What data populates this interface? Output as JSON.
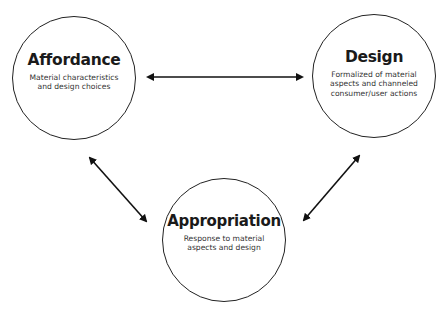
{
  "diagram": {
    "nodes": [
      {
        "id": "affordance",
        "title": "Affordance",
        "description": "Material characteristics\nand design choices"
      },
      {
        "id": "design",
        "title": "Design",
        "description": "Formalized of material\naspects and channeled\nconsumer/user actions"
      },
      {
        "id": "appropriation",
        "title": "Appropriation",
        "description": "Response to material\naspects and design"
      }
    ],
    "edges": [
      {
        "from": "affordance",
        "to": "design",
        "direction": "bidirectional"
      },
      {
        "from": "affordance",
        "to": "appropriation",
        "direction": "bidirectional"
      },
      {
        "from": "design",
        "to": "appropriation",
        "direction": "bidirectional"
      }
    ],
    "colors": {
      "stroke": "#222222",
      "background": "#ffffff"
    }
  }
}
